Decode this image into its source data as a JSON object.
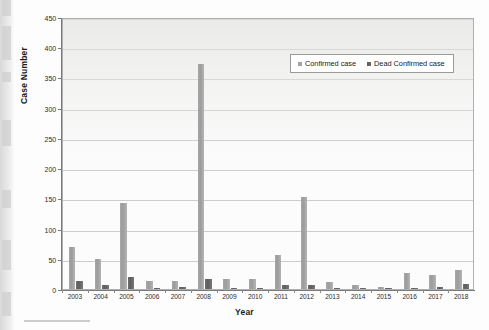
{
  "chart_data": {
    "type": "bar",
    "title": "",
    "xlabel": "Year",
    "ylabel": "Case Number",
    "ylim": [
      0,
      450
    ],
    "ytick_step": 50,
    "yticks": [
      0,
      50,
      100,
      150,
      200,
      250,
      300,
      350,
      400,
      450
    ],
    "ytick_labels": [
      "0",
      "50",
      "100",
      "150",
      "200",
      "250",
      "300",
      "350",
      "400",
      "450"
    ],
    "grid": true,
    "grid_axis": "y",
    "legend_position": "upper right",
    "categories": [
      "2003",
      "2004",
      "2005",
      "2006",
      "2007",
      "2008",
      "2009",
      "2010",
      "2011",
      "2012",
      "2013",
      "2014",
      "2015",
      "2016",
      "2017",
      "2018"
    ],
    "series": [
      {
        "name": "Confirmed case",
        "color": "#a3a3a3",
        "values": [
          69,
          49,
          142,
          14,
          13,
          372,
          17,
          16,
          57,
          152,
          11,
          6,
          4,
          27,
          24,
          32
        ]
      },
      {
        "name": "Dead Confirmed case",
        "color": "#636363",
        "values": [
          13,
          6,
          20,
          1,
          4,
          16,
          1,
          1,
          6,
          6,
          2,
          1,
          1,
          2,
          3,
          9
        ]
      }
    ]
  },
  "axes": {
    "y_title": "Case Number",
    "x_title": "Year"
  },
  "legend": {
    "entries": [
      {
        "label": "Confirmed case",
        "swatch": "legend-swatch-confirmed"
      },
      {
        "label": "Dead Confirmed case",
        "swatch": "legend-swatch-dead"
      }
    ]
  },
  "caption": {
    "text": ""
  },
  "colors": {
    "confirmed": "#a3a3a3",
    "dead": "#636363",
    "grid": "#cccccc",
    "axis": "#7a7a7a",
    "plot_background": "#fcfcfc"
  }
}
